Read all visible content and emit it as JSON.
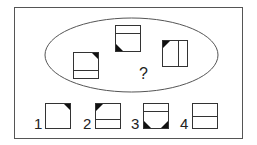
{
  "puzzle": {
    "question_mark": "?",
    "colors": {
      "line": "#333333",
      "fill": "#111111",
      "frame": "#555555"
    },
    "sequence": [
      {
        "id": "A",
        "divider": "horizontal-lower",
        "corner": "top-right"
      },
      {
        "id": "B",
        "divider": "horizontal-upper",
        "corner": "bottom-left"
      },
      {
        "id": "C",
        "divider": "vertical-right",
        "corner": "top-left"
      }
    ],
    "options": [
      {
        "label": "1",
        "divider": "none",
        "corners": [
          "top-right"
        ]
      },
      {
        "label": "2",
        "divider": "horizontal-lower",
        "corners": [
          "top-left"
        ]
      },
      {
        "label": "3",
        "divider": "horizontal-upper",
        "corners": [
          "bottom-left",
          "bottom-right"
        ]
      },
      {
        "label": "4",
        "divider": "horizontal-middle",
        "corners": []
      }
    ]
  }
}
